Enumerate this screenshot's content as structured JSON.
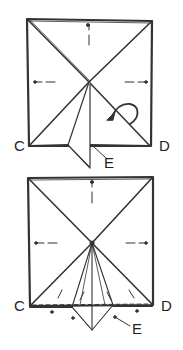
{
  "diagram": {
    "type": "origami-instruction",
    "steps": [
      {
        "id": "step-1",
        "labels": {
          "left_corner": "C",
          "right_corner": "D",
          "flap_point": "E"
        },
        "annotations": [
          "center-point",
          "valley-fold-dashes",
          "fold-arrow-curved"
        ]
      },
      {
        "id": "step-2",
        "labels": {
          "left_corner": "C",
          "right_corner": "D",
          "flap_point": "E"
        },
        "annotations": [
          "center-point",
          "valley-fold-dashes",
          "hidden-edge-dashed-line"
        ]
      }
    ],
    "colors": {
      "line": "#333333",
      "background": "#ffffff"
    }
  }
}
